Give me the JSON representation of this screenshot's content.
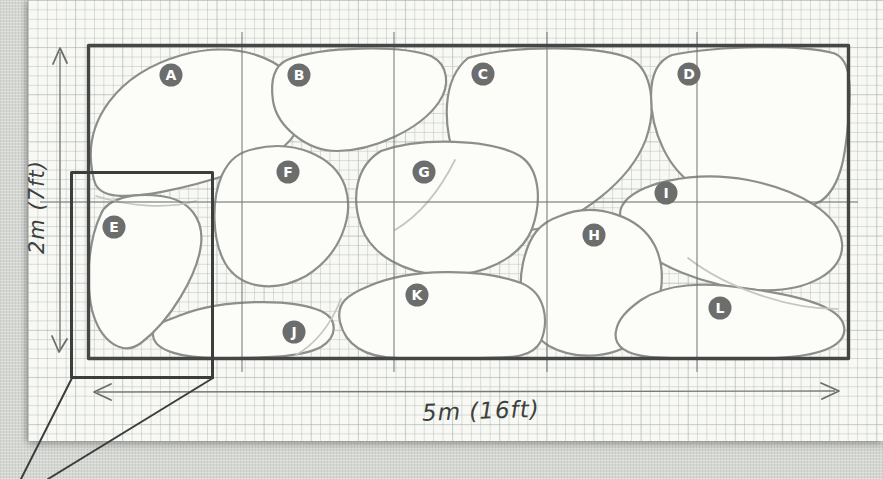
{
  "diagram": {
    "kind": "hand-drawn stone paving layout sketch on graph paper",
    "dimensions": {
      "height_label": "2m (7ft)",
      "width_label": "5m (16ft)"
    },
    "frame": {
      "x": 88.5,
      "y": 45.5,
      "w": 760,
      "h": 313
    },
    "detail_box": {
      "x": 71.5,
      "y": 172.5,
      "w": 141,
      "h": 205
    },
    "callout_lines": [
      [
        72,
        378,
        21,
        479
      ],
      [
        213,
        378,
        48,
        479
      ]
    ],
    "pencil_grid": {
      "verticals_x": [
        242,
        394,
        547,
        697
      ],
      "vertical_y1": 32,
      "vertical_y2": 372,
      "horizontal_y": 202,
      "horizontal_x1": 40,
      "horizontal_x2": 858
    },
    "stones": [
      {
        "label": "A",
        "lx": 171,
        "ly": 75,
        "path": "M 92 170 C 84 122 116 74 182 55 C 236 40 289 58 301 94 C 312 128 283 157 236 172 C 188 188 132 201 108 194 C 95 190 94 182 92 170 Z"
      },
      {
        "label": "B",
        "lx": 299,
        "ly": 75,
        "path": "M 287 60 C 322 46 402 45 431 56 C 449 65 450 86 439 102 C 420 130 372 151 337 151 C 306 151 277 126 273 101 C 270 80 274 66 287 60 Z"
      },
      {
        "label": "C",
        "lx": 483,
        "ly": 74,
        "path": "M 468 58 C 512 45 601 45 631 59 C 652 70 657 108 646 139 C 630 182 577 221 537 229 C 506 235 471 201 456 161 C 443 127 441 80 468 58 Z"
      },
      {
        "label": "D",
        "lx": 689,
        "ly": 74,
        "path": "M 672 55 C 722 45 801 45 833 53 C 850 58 851 82 849 112 C 846 152 842 186 821 201 C 790 219 731 206 696 186 C 668 170 651 131 651 96 C 651 72 659 60 672 55 Z"
      },
      {
        "label": "I",
        "lx": 666,
        "ly": 193,
        "path": "M 622 206 C 634 183 694 170 748 180 C 800 190 839 214 842 243 C 845 271 808 293 757 290 C 706 287 650 264 632 239 C 622 225 617 215 622 206 Z"
      },
      {
        "label": "F",
        "lx": 288,
        "ly": 172,
        "path": "M 254 149 C 294 139 334 156 345 186 C 355 216 340 255 306 276 C 275 293 240 289 225 263 C 212 240 211 200 222 175 C 230 158 240 152 254 149 Z"
      },
      {
        "label": "G",
        "lx": 424,
        "ly": 172,
        "path": "M 381 151 C 421 137 491 139 520 156 C 540 169 542 201 532 229 C 520 259 481 277 441 275 C 406 273 371 256 361 226 C 351 197 356 166 381 151 Z"
      },
      {
        "label": "H",
        "lx": 594,
        "ly": 235,
        "path": "M 560 216 C 595 201 640 216 655 246 C 668 273 662 311 640 336 C 618 359 576 361 549 346 C 525 331 516 296 523 263 C 529 236 539 223 560 216 Z"
      },
      {
        "label": "J",
        "lx": 294,
        "ly": 332,
        "path": "M 181 315 C 222 299 291 298 321 311 C 338 319 338 336 321 347 C 298 359 252 358 216 358 C 186 358 154 352 153 335 C 152 324 163 322 181 315 Z"
      },
      {
        "label": "K",
        "lx": 417,
        "ly": 295,
        "path": "M 369 286 C 410 268 481 268 521 283 C 546 293 549 321 541 341 C 533 357 515 358 478 358 L 399 358 C 364 358 345 344 340 322 C 336 303 347 295 369 286 Z"
      },
      {
        "label": "L",
        "lx": 720,
        "ly": 308,
        "path": "M 641 300 C 666 284 701 281 751 289 C 801 296 836 306 843 323 C 849 339 835 351 799 356 C 759 361 682 359 651 357 C 626 355 613 346 616 331 C 618 319 627 310 641 300 Z"
      },
      {
        "label": "E",
        "lx": 114,
        "ly": 227,
        "path": "M 101 214 C 107 199 132 192 161 196 C 190 200 204 219 201 245 C 197 276 170 321 141 343 C 122 357 100 341 92 310 C 85 279 89 239 101 214 Z"
      }
    ],
    "ghost_strokes": [
      "M 96 196 C 130 207 168 209 196 201",
      "M 341 299 C 331 324 315 344 296 355",
      "M 688 258 C 728 289 790 309 838 309",
      "M 455 160 C 440 190 420 215 395 230"
    ],
    "colors": {
      "paper": "#f8f8f4",
      "fabric": "#d5d7d3",
      "stone_fill": "#fcfcf9",
      "stone_stroke": "#8b8e8b",
      "pencil_dark": "#3c3d3d",
      "label_circle": "#6c6e6d",
      "label_text": "#ffffff"
    }
  }
}
